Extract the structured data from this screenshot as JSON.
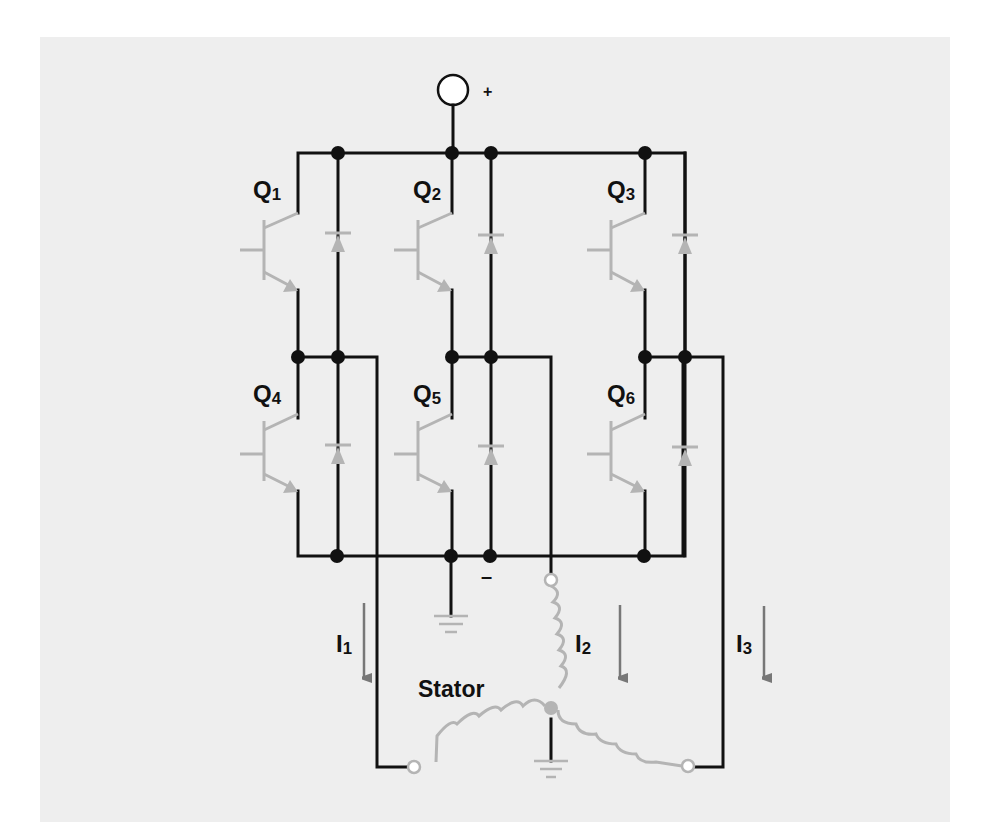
{
  "diagram": {
    "colors": {
      "background": "#eeeeee",
      "wire": "#111111",
      "component": "#b4b4b4",
      "arrow": "#777777"
    },
    "supply": {
      "positive_label": "+",
      "negative_label": "–"
    },
    "transistors": [
      {
        "id": "Q1",
        "label": "Q",
        "sub": "1",
        "x": 298,
        "top": 153,
        "mid": 357,
        "lx": 253,
        "ly": 198
      },
      {
        "id": "Q2",
        "label": "Q",
        "sub": "2",
        "x": 452,
        "top": 153,
        "mid": 357,
        "lx": 413,
        "ly": 198
      },
      {
        "id": "Q3",
        "label": "Q",
        "sub": "3",
        "x": 645,
        "top": 153,
        "mid": 357,
        "lx": 607,
        "ly": 198
      },
      {
        "id": "Q4",
        "label": "Q",
        "sub": "4",
        "x": 298,
        "top": 357,
        "mid": 556,
        "lx": 253,
        "ly": 402
      },
      {
        "id": "Q5",
        "label": "Q",
        "sub": "5",
        "x": 452,
        "top": 357,
        "mid": 556,
        "lx": 413,
        "ly": 402
      },
      {
        "id": "Q6",
        "label": "Q",
        "sub": "6",
        "x": 645,
        "top": 357,
        "mid": 556,
        "lx": 607,
        "ly": 402
      }
    ],
    "currents": [
      {
        "id": "I1",
        "label": "I",
        "sub": "1",
        "lx": 335,
        "ly": 672,
        "arrow_x": 364,
        "arrow_y1": 603,
        "arrow_y2": 688
      },
      {
        "id": "I2",
        "label": "I",
        "sub": "2",
        "lx": 575,
        "ly": 652,
        "arrow_x": 620,
        "arrow_y1": 605,
        "arrow_y2": 688
      },
      {
        "id": "I3",
        "label": "I",
        "sub": "3",
        "lx": 736,
        "ly": 652,
        "arrow_x": 764,
        "arrow_y1": 606,
        "arrow_y2": 688
      }
    ],
    "stator": {
      "label": "Stator",
      "lx": 418,
      "ly": 697
    }
  }
}
